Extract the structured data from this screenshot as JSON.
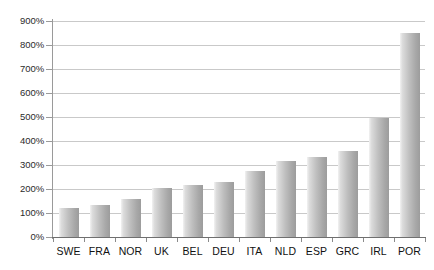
{
  "chart_data": {
    "type": "bar",
    "title": "",
    "subtitle": "",
    "xlabel": "",
    "ylabel": "",
    "categories": [
      "SWE",
      "FRA",
      "NOR",
      "UK",
      "BEL",
      "DEU",
      "ITA",
      "NLD",
      "ESP",
      "GRC",
      "IRL",
      "POR"
    ],
    "values": [
      122,
      135,
      160,
      205,
      215,
      230,
      275,
      315,
      335,
      360,
      497,
      850
    ],
    "value_unit": "%",
    "ylim": [
      0,
      900
    ],
    "ytick_values": [
      0,
      100,
      200,
      300,
      400,
      500,
      600,
      700,
      800,
      900
    ],
    "ytick_labels": [
      "0%",
      "100%",
      "200%",
      "300%",
      "400%",
      "500%",
      "600%",
      "700%",
      "800%",
      "900%"
    ],
    "grid": "horizontal",
    "legend": "none",
    "series": [
      {
        "name": "",
        "values": [
          122,
          135,
          160,
          205,
          215,
          230,
          275,
          315,
          335,
          360,
          497,
          850
        ]
      }
    ],
    "colors": {
      "bar_light": "#f2f2f2",
      "bar_mid": "#bfbfbf",
      "bar_dark": "#9c9c9c",
      "gridline": "#c9c9c9",
      "axis": "#6f6f6f",
      "label_text": "#111111",
      "ytick_text": "#2b2b2b",
      "background": "#ffffff"
    }
  }
}
